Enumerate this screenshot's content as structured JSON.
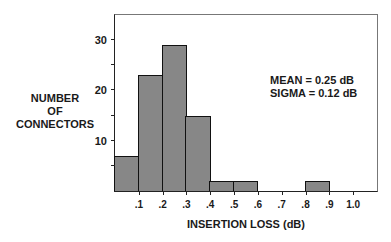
{
  "chart_data": {
    "type": "bar",
    "title": "",
    "xlabel": "INSERTION LOSS (dB)",
    "ylabel": "NUMBER OF CONNECTORS",
    "ylabel_lines": [
      "NUMBER",
      "OF",
      "CONNECTORS"
    ],
    "categories": [
      "0-.1",
      ".1-.2",
      ".2-.3",
      ".3-.4",
      ".4-.5",
      ".5-.6",
      ".6-.7",
      ".7-.8",
      ".8-.9",
      ".9-1.0"
    ],
    "bin_edges": [
      0,
      0.1,
      0.2,
      0.3,
      0.4,
      0.5,
      0.6,
      0.7,
      0.8,
      0.9,
      1.0
    ],
    "values": [
      7,
      23,
      29,
      15,
      2,
      2,
      0,
      0,
      2,
      0
    ],
    "x_ticks": [
      ".1",
      ".2",
      ".3",
      ".4",
      ".5",
      ".6",
      ".7",
      ".8",
      ".9",
      "1.0"
    ],
    "y_ticks": [
      "10",
      "20",
      "30"
    ],
    "y_minor_ticks": [
      5,
      15,
      25
    ],
    "xlim": [
      0,
      1.1
    ],
    "ylim": [
      0,
      35
    ],
    "grid": false,
    "annotations": [
      "MEAN = 0.25 dB",
      "SIGMA = 0.12 dB"
    ]
  }
}
